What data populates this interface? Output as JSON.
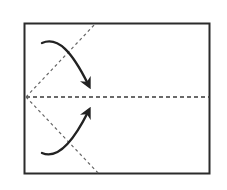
{
  "diagram": {
    "type": "origami-fold-instruction",
    "colors": {
      "paper_outline": "#2b2b2b",
      "fold_line": "#555555",
      "arrow": "#222222",
      "background": "#ffffff"
    },
    "paper": {
      "x": 24,
      "y": 23,
      "width": 186,
      "height": 151
    },
    "fold_lines": [
      {
        "name": "center-crease",
        "style": "dashed",
        "x1": 26,
        "y1": 97,
        "x2": 210,
        "y2": 97
      },
      {
        "name": "upper-diagonal-fold",
        "style": "dashed",
        "x1": 26,
        "y1": 97,
        "x2": 96,
        "y2": 23
      },
      {
        "name": "lower-diagonal-fold",
        "style": "dashed",
        "x1": 26,
        "y1": 97,
        "x2": 99,
        "y2": 174
      }
    ],
    "arrows": [
      {
        "name": "upper-fold-arrow",
        "direction": "down",
        "path": "M42,43 C58,36 72,52 88,84"
      },
      {
        "name": "lower-fold-arrow",
        "direction": "up",
        "path": "M42,153 C58,160 74,140 88,112"
      }
    ]
  }
}
